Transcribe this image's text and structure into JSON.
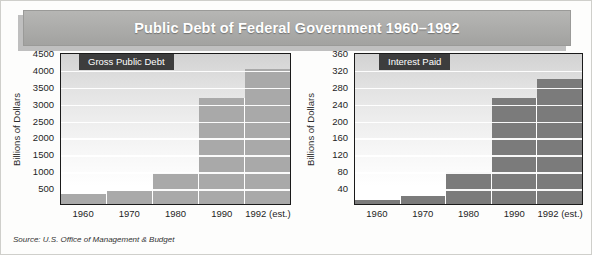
{
  "banner": {
    "title": "Public Debt of Federal Government 1960–1992"
  },
  "source": {
    "text": "Source: U.S. Office of Management & Budget"
  },
  "colors": {
    "banner_fill": "#adadab",
    "banner_text": "#ffffff",
    "badge_fill": "#3d3d3d",
    "badge_text": "#ffffff",
    "left_bar": "#a9a9a9",
    "right_bar": "#7b7b7b",
    "axis": "#1a1a1a",
    "gridline": "#ffffff",
    "page_background": "#fdfdfc"
  },
  "chart_data": [
    {
      "type": "bar",
      "title": "Gross Public Debt",
      "xlabel": "",
      "ylabel": "Billions of Dollars",
      "categories": [
        "1960",
        "1970",
        "1980",
        "1990",
        "1992 (est.)"
      ],
      "values": [
        290,
        380,
        910,
        3150,
        4000
      ],
      "ylim": [
        0,
        4500
      ],
      "yticks": [
        500,
        1000,
        1500,
        2000,
        2500,
        3000,
        3500,
        4000,
        4500
      ],
      "grid": true,
      "legend": "none"
    },
    {
      "type": "bar",
      "title": "Interest Paid",
      "xlabel": "",
      "ylabel": "Billions of Dollars",
      "categories": [
        "1960",
        "1970",
        "1980",
        "1990",
        "1992 (est.)"
      ],
      "values": [
        9,
        18,
        75,
        250,
        295
      ],
      "ylim": [
        0,
        360
      ],
      "yticks": [
        40,
        80,
        120,
        160,
        200,
        240,
        280,
        320,
        360
      ],
      "grid": true,
      "legend": "none"
    }
  ]
}
